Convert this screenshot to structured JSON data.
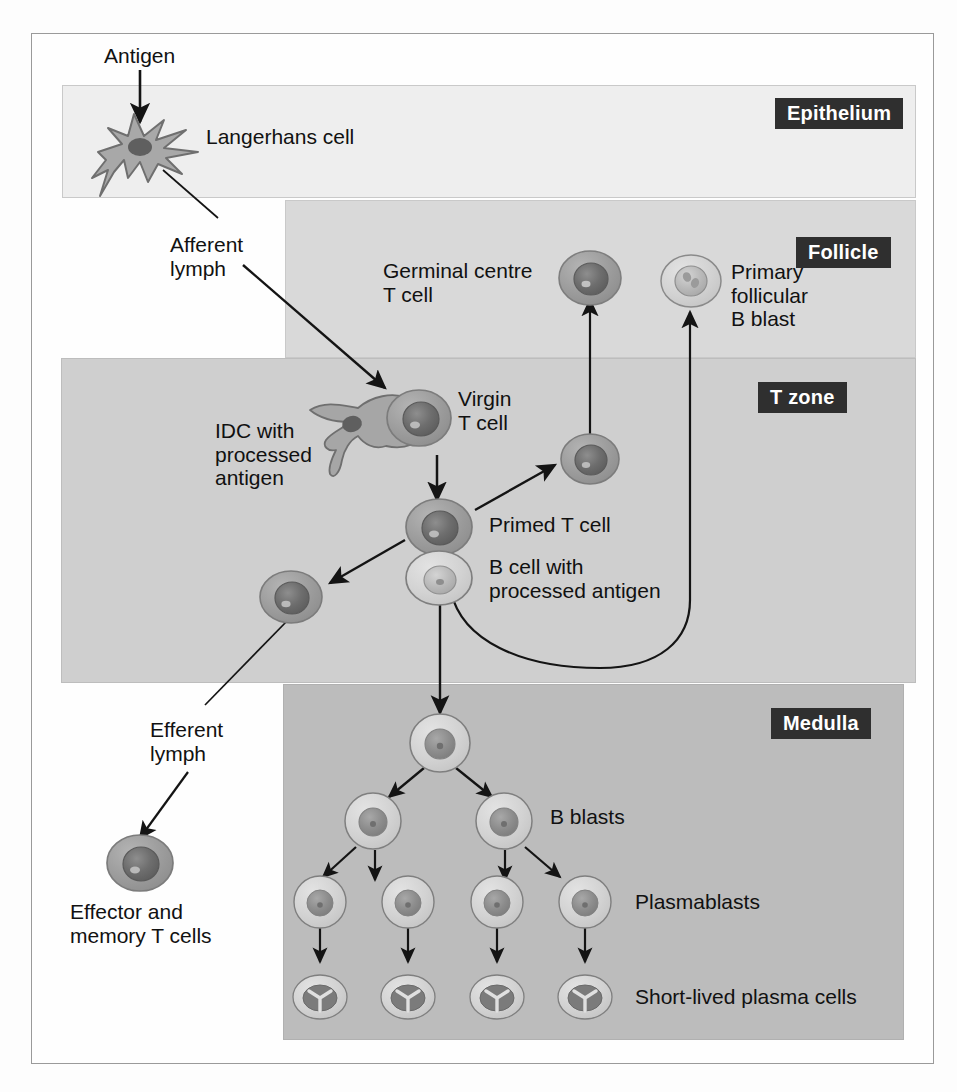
{
  "figure": {
    "colors": {
      "epithelium_bg": "#eeeeee",
      "follicle_bg": "#d9d9d9",
      "tzone_bg": "#cfcfcf",
      "medulla_bg": "#bcbcbc",
      "badge_bg": "#2f2f2f",
      "badge_text": "#ffffff",
      "line": "#1a1a1a",
      "cell_membrane_dark": "#9a9a9a",
      "cell_membrane_light": "#d0d0d0",
      "nucleus_dark": "#6e6e6e",
      "nucleus_mid": "#8f8f8f",
      "nucleus_light": "#c4c4c4"
    }
  },
  "zones": [
    {
      "key": "epithelium",
      "label": "Epithelium"
    },
    {
      "key": "follicle",
      "label": "Follicle"
    },
    {
      "key": "tzone",
      "label": "T zone"
    },
    {
      "key": "medulla",
      "label": "Medulla"
    }
  ],
  "labels": {
    "antigen": "Antigen",
    "langerhans_cell": "Langerhans cell",
    "afferent_lymph": "Afferent\nlymph",
    "germinal_centre_t_cell": "Germinal centre\nT cell",
    "primary_follicular_b_blast": "Primary\nfollicular\nB blast",
    "idc_with_processed_antigen": "IDC with\nprocessed\nantigen",
    "virgin_t_cell": "Virgin\nT cell",
    "primed_t_cell": "Primed T cell",
    "b_cell_with_processed_antigen": "B cell with\nprocessed antigen",
    "efferent_lymph": "Efferent\nlymph",
    "effector_and_memory_t_cells": "Effector and\nmemory T cells",
    "b_blasts": "B blasts",
    "plasmablasts": "Plasmablasts",
    "short_lived_plasma_cells": "Short-lived plasma cells"
  },
  "cells": {
    "langerhans": {
      "type": "dendritic-star",
      "zone": "epithelium"
    },
    "germinal_centre_t_cell": {
      "type": "round-dark-nucleus",
      "zone": "follicle"
    },
    "primary_follicular_b_blast": {
      "type": "round-pale-lobed-nucleus",
      "zone": "follicle"
    },
    "idc": {
      "type": "dendritic-elongated",
      "zone": "tzone"
    },
    "virgin_t_cell": {
      "type": "round-dark-nucleus",
      "zone": "tzone"
    },
    "primed_t_cell": {
      "type": "round-dark-nucleus",
      "zone": "tzone"
    },
    "germinal_centre_t_cell_destination": {
      "type": "round-dark-nucleus",
      "zone": "follicle"
    },
    "effector_memory_t_cell": {
      "type": "round-dark-nucleus",
      "zone": "outside"
    },
    "b_cell_processed_antigen": {
      "type": "round-pale-nucleus",
      "zone": "tzone"
    },
    "medulla_founder_b_blast": {
      "type": "round-pale-nucleus",
      "zone": "medulla"
    },
    "b_blasts_count": 2,
    "plasmablasts_count": 4,
    "short_lived_plasma_cells_count": 4
  },
  "flow": {
    "arrows": [
      {
        "from": "antigen",
        "to": "langerhans-cell"
      },
      {
        "from": "langerhans-cell",
        "to": "idc",
        "via": "afferent-lymph"
      },
      {
        "from": "virgin-t-cell",
        "to": "primed-t-cell"
      },
      {
        "from": "primed-t-cell",
        "to": "germinal-centre-t-cell"
      },
      {
        "from": "primed-t-cell",
        "to": "effector-memory-t-cell"
      },
      {
        "from": "effector-memory-t-cell",
        "to": "efferent-lymph-cell"
      },
      {
        "from": "b-cell-processed-antigen",
        "to": "primary-follicular-b-blast"
      },
      {
        "from": "b-cell-processed-antigen",
        "to": "medulla-founder-b-blast"
      },
      {
        "from": "medulla-founder-b-blast",
        "to": "b-blasts"
      },
      {
        "from": "b-blasts",
        "to": "plasmablasts"
      },
      {
        "from": "plasmablasts",
        "to": "short-lived-plasma-cells"
      }
    ]
  }
}
